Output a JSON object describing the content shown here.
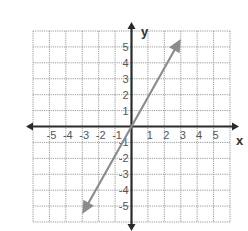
{
  "chart_data": {
    "type": "line",
    "title": "",
    "xlabel": "x",
    "ylabel": "y",
    "xlim": [
      -6,
      6
    ],
    "ylim": [
      -6,
      6
    ],
    "grid": true,
    "x_ticks": [
      -5,
      -4,
      -3,
      -2,
      -1,
      1,
      2,
      3,
      4,
      5
    ],
    "y_ticks": [
      -5,
      -4,
      -3,
      -2,
      -1,
      1,
      2,
      3,
      4,
      5
    ],
    "x_tick_labels": [
      "-5",
      "-4",
      "-3",
      "-2",
      "-1",
      "1",
      "2",
      "3",
      "4",
      "5"
    ],
    "y_tick_labels": [
      "-5",
      "-4",
      "-3",
      "-2",
      "-1",
      "1",
      "2",
      "3",
      "4",
      "5"
    ],
    "series": [
      {
        "name": "line",
        "description": "straight line through origin with arrows at both ends",
        "x": [
          -3,
          0,
          3
        ],
        "y": [
          -5.5,
          0,
          5.5
        ],
        "arrows": "both"
      }
    ],
    "legend": null
  },
  "colors": {
    "grid": "#9a9a9a",
    "axis": "#2b2b2b",
    "line": "#8c8c8c",
    "label": "#555555"
  }
}
